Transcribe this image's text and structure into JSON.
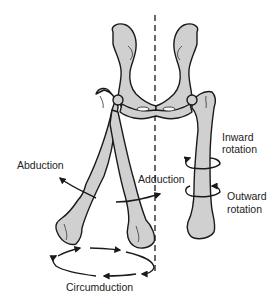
{
  "figure": {
    "type": "anatomical-diagram",
    "colors": {
      "bone_fill": "#d0d0d0",
      "outline": "#1a1a1a",
      "background": "#ffffff"
    }
  },
  "labels": {
    "abduction": "Abduction",
    "adduction": "Adduction",
    "inward_rotation_1": "Inward",
    "inward_rotation_2": "rotation",
    "outward_rotation_1": "Outward",
    "outward_rotation_2": "rotation",
    "circumduction": "Circumduction"
  }
}
